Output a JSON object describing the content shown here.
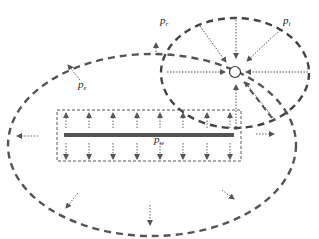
{
  "labels": {
    "p_r": {
      "base": "p",
      "sub": "r"
    },
    "p_i": {
      "base": "p",
      "sub": "i"
    },
    "p_e": {
      "base": "p",
      "sub": "e"
    },
    "p_w": {
      "base": "p",
      "sub": "w"
    }
  },
  "colors": {
    "boundary": "#555555",
    "arrow": "#666666",
    "fracture": "#555555",
    "text": "#222222"
  }
}
